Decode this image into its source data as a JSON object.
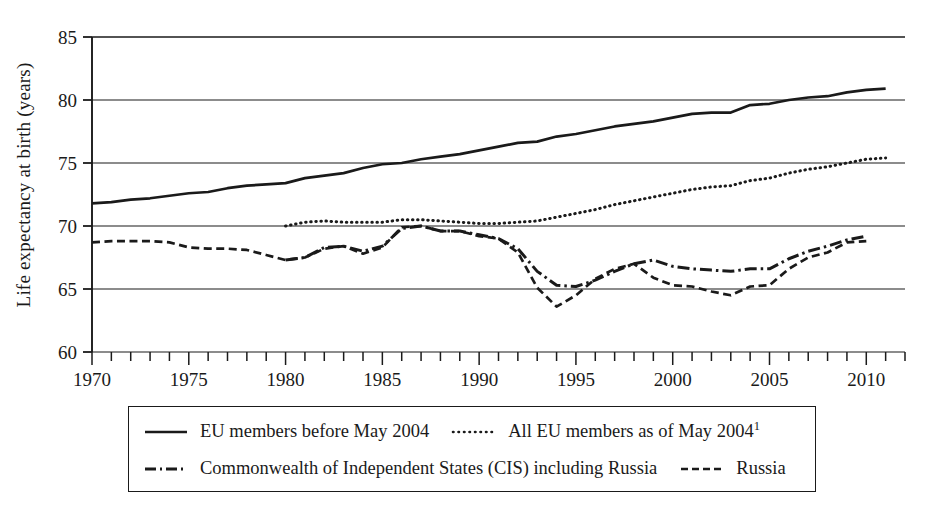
{
  "chart_data": {
    "type": "line",
    "title": "",
    "xlabel": "",
    "ylabel": "Life expectancy at birth (years)",
    "xlim": [
      1970,
      2012
    ],
    "ylim": [
      60,
      85
    ],
    "ytick_labels": [
      "60",
      "65",
      "70",
      "75",
      "80",
      "85"
    ],
    "yticks": [
      60,
      65,
      70,
      75,
      80,
      85
    ],
    "xtick_labels": [
      "1970",
      "1975",
      "1980",
      "1985",
      "1990",
      "1995",
      "2000",
      "2005",
      "2010"
    ],
    "xticks": [
      1970,
      1975,
      1980,
      1985,
      1990,
      1995,
      2000,
      2005,
      2010
    ],
    "minor_xtick_interval": 1,
    "grid": "horizontal",
    "legend_position": "below-plot",
    "line_color": "#1a1a1a",
    "series": [
      {
        "name": "EU members before May 2004",
        "style": "solid",
        "x": [
          1970,
          1971,
          1972,
          1973,
          1974,
          1975,
          1976,
          1977,
          1978,
          1979,
          1980,
          1981,
          1982,
          1983,
          1984,
          1985,
          1986,
          1987,
          1988,
          1989,
          1990,
          1991,
          1992,
          1993,
          1994,
          1995,
          1996,
          1997,
          1998,
          1999,
          2000,
          2001,
          2002,
          2003,
          2004,
          2005,
          2006,
          2007,
          2008,
          2009,
          2010,
          2011
        ],
        "values": [
          71.8,
          71.9,
          72.1,
          72.2,
          72.4,
          72.6,
          72.7,
          73.0,
          73.2,
          73.3,
          73.4,
          73.8,
          74.0,
          74.2,
          74.6,
          74.9,
          75.0,
          75.3,
          75.5,
          75.7,
          76.0,
          76.3,
          76.6,
          76.7,
          77.1,
          77.3,
          77.6,
          77.9,
          78.1,
          78.3,
          78.6,
          78.9,
          79.0,
          79.0,
          79.6,
          79.7,
          80.0,
          80.2,
          80.3,
          80.6,
          80.8,
          80.9
        ]
      },
      {
        "name": "All EU members as of May 2004",
        "style": "dotted",
        "x": [
          1980,
          1981,
          1982,
          1983,
          1984,
          1985,
          1986,
          1987,
          1988,
          1989,
          1990,
          1991,
          1992,
          1993,
          1994,
          1995,
          1996,
          1997,
          1998,
          1999,
          2000,
          2001,
          2002,
          2003,
          2004,
          2005,
          2006,
          2007,
          2008,
          2009,
          2010,
          2011
        ],
        "values": [
          70.0,
          70.3,
          70.4,
          70.3,
          70.3,
          70.3,
          70.5,
          70.5,
          70.4,
          70.3,
          70.2,
          70.2,
          70.3,
          70.4,
          70.7,
          71.0,
          71.3,
          71.7,
          72.0,
          72.3,
          72.6,
          72.9,
          73.1,
          73.2,
          73.6,
          73.8,
          74.2,
          74.5,
          74.7,
          75.0,
          75.3,
          75.4
        ]
      },
      {
        "name": "Commonwealth of Independent States (CIS) including Russia",
        "style": "dash-dot",
        "x": [
          1980,
          1981,
          1982,
          1983,
          1984,
          1985,
          1986,
          1987,
          1988,
          1989,
          1990,
          1991,
          1992,
          1993,
          1994,
          1995,
          1996,
          1997,
          1998,
          1999,
          2000,
          2001,
          2002,
          2003,
          2004,
          2005,
          2006,
          2007,
          2008,
          2009,
          2010
        ],
        "values": [
          67.3,
          67.5,
          68.3,
          68.4,
          68.0,
          68.4,
          69.8,
          70.0,
          69.6,
          69.6,
          69.3,
          69.0,
          68.2,
          66.4,
          65.3,
          65.2,
          65.7,
          66.4,
          67.0,
          67.3,
          66.8,
          66.6,
          66.5,
          66.4,
          66.6,
          66.6,
          67.4,
          68.0,
          68.4,
          68.9,
          69.2
        ]
      },
      {
        "name": "Russia",
        "style": "dashed",
        "x": [
          1970,
          1971,
          1972,
          1973,
          1974,
          1975,
          1976,
          1977,
          1978,
          1979,
          1980,
          1981,
          1982,
          1983,
          1984,
          1985,
          1986,
          1987,
          1988,
          1989,
          1990,
          1991,
          1992,
          1993,
          1994,
          1995,
          1996,
          1997,
          1998,
          1999,
          2000,
          2001,
          2002,
          2003,
          2004,
          2005,
          2006,
          2007,
          2008,
          2009,
          2010
        ],
        "values": [
          68.7,
          68.8,
          68.8,
          68.8,
          68.7,
          68.3,
          68.2,
          68.2,
          68.1,
          67.7,
          67.3,
          67.5,
          68.2,
          68.4,
          67.8,
          68.3,
          69.9,
          70.0,
          69.6,
          69.6,
          69.2,
          69.0,
          67.9,
          65.1,
          63.6,
          64.5,
          65.8,
          66.6,
          67.0,
          65.9,
          65.3,
          65.2,
          64.8,
          64.5,
          65.2,
          65.3,
          66.6,
          67.5,
          67.9,
          68.7,
          68.8
        ]
      }
    ]
  },
  "axes": {
    "ylabel": "Life expectancy at birth (years)",
    "ytick_labels": [
      "85",
      "80",
      "75",
      "70",
      "65",
      "60"
    ],
    "xtick_labels": [
      "1970",
      "1975",
      "1980",
      "1985",
      "1990",
      "1995",
      "2000",
      "2005",
      "2010"
    ]
  },
  "legend": {
    "rows": [
      [
        {
          "style": "solid",
          "label": "EU members before May 2004",
          "footnote": ""
        },
        {
          "style": "dotted",
          "label": "All EU members as of May 2004",
          "footnote": "1"
        }
      ],
      [
        {
          "style": "dash-dot",
          "label": "Commonwealth of Independent States (CIS) including Russia",
          "footnote": ""
        },
        {
          "style": "dashed",
          "label": "Russia",
          "footnote": ""
        }
      ]
    ]
  }
}
